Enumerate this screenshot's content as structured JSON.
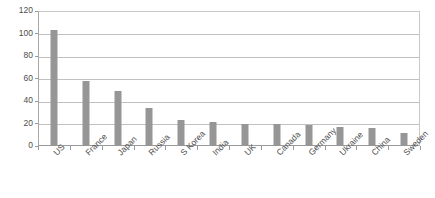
{
  "chart_data": {
    "type": "bar",
    "title": "",
    "subtitle": "",
    "xlabel": "",
    "ylabel": "",
    "categories": [
      "US",
      "France",
      "Japan",
      "Russia",
      "S Korea",
      "India",
      "UK",
      "Canada",
      "Germany",
      "Ukraine",
      "China",
      "Sweden"
    ],
    "values": [
      103,
      58,
      49,
      34,
      23,
      21,
      20,
      20,
      19,
      17,
      16,
      12
    ],
    "ylim": [
      0,
      120
    ],
    "ytick_step": 20,
    "ytick_labels": [
      "0",
      "20",
      "40",
      "60",
      "80",
      "100",
      "120"
    ],
    "grid": "horizontal",
    "legend": "none",
    "series": [
      {
        "name": "",
        "values": [
          103,
          58,
          49,
          34,
          23,
          21,
          20,
          20,
          19,
          17,
          16,
          12
        ]
      }
    ]
  },
  "style": {
    "bar_color": "#969696",
    "gridline_color": "#c0c0c0",
    "axis_color": "#9a9a9a",
    "text_color": "#4d4d4d",
    "plot_background": "#ffffff"
  }
}
